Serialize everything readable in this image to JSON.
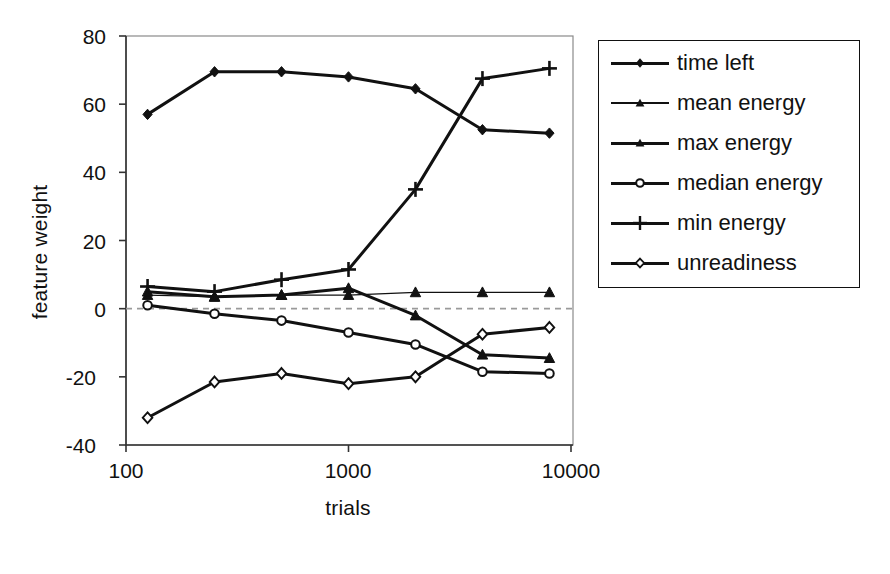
{
  "chart_data": {
    "type": "line",
    "title": "",
    "xlabel": "trials",
    "ylabel": "feature weight",
    "xscale": "log",
    "xlim": [
      100,
      10000
    ],
    "ylim": [
      -40,
      80
    ],
    "yticks": [
      "80",
      "60",
      "40",
      "20",
      "0",
      "-20",
      "-40"
    ],
    "ytick_values": [
      80,
      60,
      40,
      20,
      0,
      -20,
      -40
    ],
    "xticks": [
      "100",
      "1000",
      "10000"
    ],
    "xtick_values": [
      100,
      1000,
      10000
    ],
    "grid": false,
    "zero_line": true,
    "legend_position": "right",
    "x": [
      125,
      250,
      500,
      1000,
      2000,
      4000,
      8000
    ],
    "series": [
      {
        "name": "time left",
        "marker": "filled-diamond",
        "line": "thick",
        "values": [
          57.0,
          69.5,
          69.5,
          68.0,
          64.5,
          52.5,
          51.5
        ]
      },
      {
        "name": "mean energy",
        "marker": "filled-triangle",
        "line": "thin",
        "values": [
          4.0,
          3.5,
          4.0,
          4.0,
          4.8,
          4.8,
          4.8
        ]
      },
      {
        "name": "max energy",
        "marker": "filled-triangle",
        "line": "thick",
        "values": [
          5.0,
          3.5,
          4.0,
          6.0,
          -2.0,
          -13.5,
          -14.5
        ]
      },
      {
        "name": "median energy",
        "marker": "open-circle",
        "line": "thick",
        "values": [
          1.0,
          -1.5,
          -3.5,
          -7.0,
          -10.5,
          -18.5,
          -19.0
        ]
      },
      {
        "name": "min energy",
        "marker": "plus",
        "line": "thick",
        "values": [
          6.5,
          5.0,
          8.5,
          11.5,
          35.0,
          67.5,
          70.5
        ]
      },
      {
        "name": "unreadiness",
        "marker": "open-diamond",
        "line": "thick",
        "values": [
          -32.0,
          -21.5,
          -19.0,
          -22.0,
          -20.0,
          -7.5,
          -5.5
        ]
      }
    ]
  },
  "legend": {
    "entries": [
      {
        "label": "time left"
      },
      {
        "label": "mean energy"
      },
      {
        "label": "max energy"
      },
      {
        "label": "median energy"
      },
      {
        "label": "min energy"
      },
      {
        "label": "unreadiness"
      }
    ]
  },
  "colors": {
    "ink": "#111111",
    "frame": "#8a8a8a",
    "zero_line": "#9a9a9a",
    "background": "#ffffff"
  }
}
